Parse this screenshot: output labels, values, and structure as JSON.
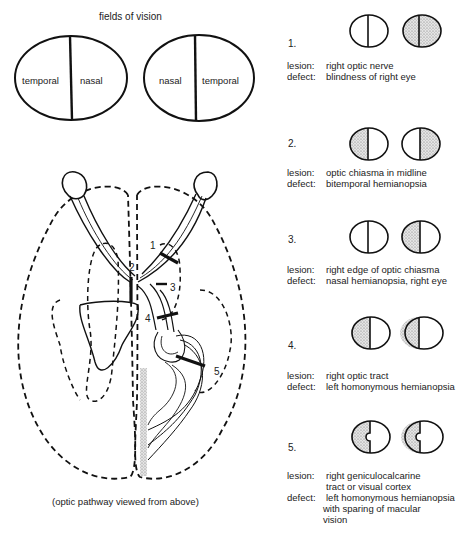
{
  "fields_of_vision": {
    "title": "fields of vision",
    "left_eye": {
      "left_label": "temporal",
      "right_label": "nasal"
    },
    "right_eye": {
      "left_label": "nasal",
      "right_label": "temporal"
    }
  },
  "pathway": {
    "caption": "(optic pathway viewed from above)",
    "markers": [
      "1",
      "2",
      "3",
      "4",
      "5"
    ]
  },
  "lesions": [
    {
      "number": "1.",
      "lesion_label": "lesion:",
      "lesion": "right optic nerve",
      "defect_label": "defect:",
      "defect": "blindness of right eye",
      "defect_cont": []
    },
    {
      "number": "2.",
      "lesion_label": "lesion:",
      "lesion": "optic chiasma in midline",
      "defect_label": "defect:",
      "defect": "bitemporal hemianopsia",
      "defect_cont": []
    },
    {
      "number": "3.",
      "lesion_label": "lesion:",
      "lesion": "right edge of optic chiasma",
      "defect_label": "defect:",
      "defect": "nasal hemianopsia, right eye",
      "defect_cont": []
    },
    {
      "number": "4.",
      "lesion_label": "lesion:",
      "lesion": "right optic tract",
      "defect_label": "defect:",
      "defect": "left homonymous hemianopsia",
      "defect_cont": []
    },
    {
      "number": "5.",
      "lesion_label": "lesion:",
      "lesion": "right geniculocalcarine",
      "lesion_cont": "tract or visual cortex",
      "defect_label": "defect:",
      "defect": "left homonymous hemianopsia",
      "defect_cont": [
        "with sparing of macular",
        "vision"
      ]
    }
  ],
  "colors": {
    "ink": "#1a1a1a",
    "stipple": "#9a9a9a",
    "background": "#ffffff"
  }
}
